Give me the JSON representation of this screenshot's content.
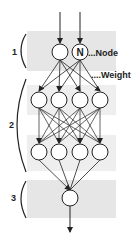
{
  "diagram": {
    "type": "neural-network",
    "layers": [
      {
        "label": "1",
        "nodes": 2
      },
      {
        "label": "2",
        "nodes": 8,
        "rows": 2,
        "per_row": 4
      },
      {
        "label": "3",
        "nodes": 1
      }
    ],
    "annotations": {
      "node_letter": "N",
      "node_label": "...Node",
      "weight_label": "....Weight"
    },
    "colors": {
      "band": "#e8e8e8",
      "line": "#222222",
      "node_fill": "#ffffff"
    }
  }
}
